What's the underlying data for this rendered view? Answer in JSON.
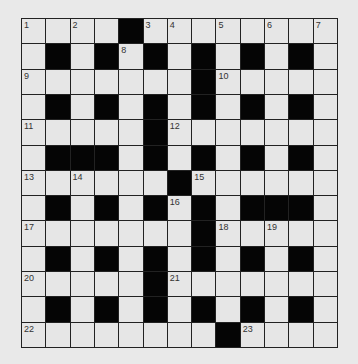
{
  "puzzle": {
    "rows": 13,
    "cols": 13,
    "colors": {
      "background": "#e9e9e9",
      "white_cell": "#e6e6e6",
      "black_cell": "#050505",
      "grid_line": "#222222"
    },
    "layout": [
      "WWWWBWWWWWWWW",
      "WBWBWBWBWBWBW",
      "WWWWWWWBWWWWW",
      "WBWBWBWBWBWBW",
      "WWWWWBWWWWWWW",
      "WBBBWBWBWBWBW",
      "WWWWWWBWWWWWW",
      "WBWBWBWBWBBBW",
      "WWWWWWWBWWWWW",
      "WBWBWBWBWBWBW",
      "WWWWWBWWWWWWW",
      "WBWBWBWBWBWBW",
      "WWWWWWWWBWWWW"
    ],
    "numbers": [
      {
        "row": 0,
        "col": 0,
        "n": "1"
      },
      {
        "row": 0,
        "col": 2,
        "n": "2"
      },
      {
        "row": 0,
        "col": 5,
        "n": "3"
      },
      {
        "row": 0,
        "col": 6,
        "n": "4"
      },
      {
        "row": 0,
        "col": 8,
        "n": "5"
      },
      {
        "row": 0,
        "col": 10,
        "n": "6"
      },
      {
        "row": 0,
        "col": 12,
        "n": "7"
      },
      {
        "row": 1,
        "col": 4,
        "n": "8"
      },
      {
        "row": 2,
        "col": 0,
        "n": "9"
      },
      {
        "row": 2,
        "col": 8,
        "n": "10"
      },
      {
        "row": 4,
        "col": 0,
        "n": "11"
      },
      {
        "row": 4,
        "col": 6,
        "n": "12"
      },
      {
        "row": 6,
        "col": 0,
        "n": "13"
      },
      {
        "row": 6,
        "col": 2,
        "n": "14"
      },
      {
        "row": 6,
        "col": 7,
        "n": "15"
      },
      {
        "row": 7,
        "col": 6,
        "n": "16"
      },
      {
        "row": 8,
        "col": 0,
        "n": "17"
      },
      {
        "row": 8,
        "col": 8,
        "n": "18"
      },
      {
        "row": 8,
        "col": 10,
        "n": "19"
      },
      {
        "row": 10,
        "col": 0,
        "n": "20"
      },
      {
        "row": 10,
        "col": 6,
        "n": "21"
      },
      {
        "row": 12,
        "col": 0,
        "n": "22"
      },
      {
        "row": 12,
        "col": 9,
        "n": "23"
      }
    ]
  }
}
